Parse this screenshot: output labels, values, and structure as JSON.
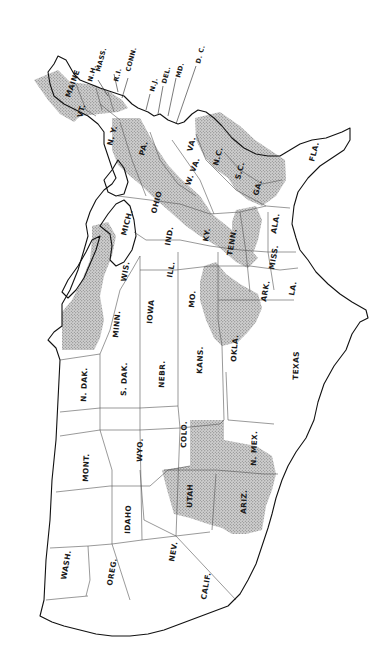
{
  "map": {
    "subject": "United States (contiguous) — state outline map with stippled shaded regions",
    "orientation": "rotated 90° clockwise (north at left, east at top)",
    "colors": {
      "background": "#ffffff",
      "outline": "#111111",
      "state_border": "#555555",
      "shading": "#9a9a9a"
    },
    "labels": {
      "maine": "MAINE",
      "vt": "VT.",
      "nh": "N.H.",
      "mass": "MASS.",
      "ri": "R.I.",
      "conn": "CONN.",
      "ny": "N. Y.",
      "nj": "N.J.",
      "del": "DEL.",
      "md": "MD.",
      "dc": "D. C.",
      "pa": "PA.",
      "ohio": "OHIO",
      "wva": "W. VA.",
      "va": "VA.",
      "nc": "N.C.",
      "sc": "S.C.",
      "ga": "GA.",
      "fla": "FLA.",
      "mich": "MICH.",
      "ind": "IND.",
      "ky": "KY.",
      "tenn": "TENN.",
      "ala": "ALA.",
      "miss": "MISS.",
      "wis": "WIS.",
      "ill": "ILL.",
      "ark": "ARK.",
      "la": "LA.",
      "minn": "MINN.",
      "iowa": "IOWA",
      "mo": "MO.",
      "okla": "OKLA.",
      "texas": "TEXAS",
      "ndak": "N. DAK.",
      "sdak": "S. DAK.",
      "nebr": "NEBR.",
      "kans": "KANS.",
      "mont": "MONT.",
      "wyo": "WYO.",
      "colo": "COLO.",
      "nmex": "N. MEX.",
      "idaho": "IDAHO",
      "utah": "UTAH",
      "ariz": "ARIZ.",
      "wash": "WASH.",
      "oreg": "OREG.",
      "nev": "NEV.",
      "calif": "CALIF."
    },
    "shaded_regions": [
      "Northern New England (Maine, N.H., Vt., Mass.)",
      "Appalachian belt (Pa., W.Va., Va., Ky., Tenn., Ala.)",
      "Carolinas & Georgia Piedmont (N.C., S.C., Ga.)",
      "Ozarks (Mo., Ark., Okla.)",
      "Upper Great Lakes (Minn., Wis., Mich.)",
      "Four Corners (Utah, Ariz., Colo., N.Mex.)"
    ]
  }
}
